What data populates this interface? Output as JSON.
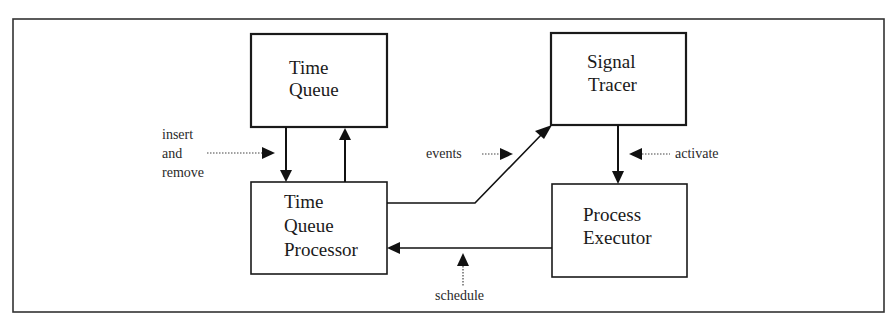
{
  "diagram": {
    "type": "block-diagram",
    "nodes": [
      {
        "id": "time_queue",
        "lines": [
          "Time",
          "Queue"
        ]
      },
      {
        "id": "time_queue_processor",
        "lines": [
          "Time",
          "Queue",
          "Processor"
        ]
      },
      {
        "id": "signal_tracer",
        "lines": [
          "Signal",
          "Tracer"
        ]
      },
      {
        "id": "process_executor",
        "lines": [
          "Process",
          "Executor"
        ]
      }
    ],
    "edges": [
      {
        "from": "time_queue",
        "to": "time_queue_processor"
      },
      {
        "from": "time_queue_processor",
        "to": "time_queue"
      },
      {
        "from": "time_queue_processor",
        "to": "signal_tracer"
      },
      {
        "from": "signal_tracer",
        "to": "process_executor"
      },
      {
        "from": "process_executor",
        "to": "time_queue_processor"
      }
    ],
    "annotations": {
      "insert_remove": [
        "insert",
        "and",
        "remove"
      ],
      "events": "events",
      "activate": "activate",
      "schedule": "schedule"
    }
  }
}
